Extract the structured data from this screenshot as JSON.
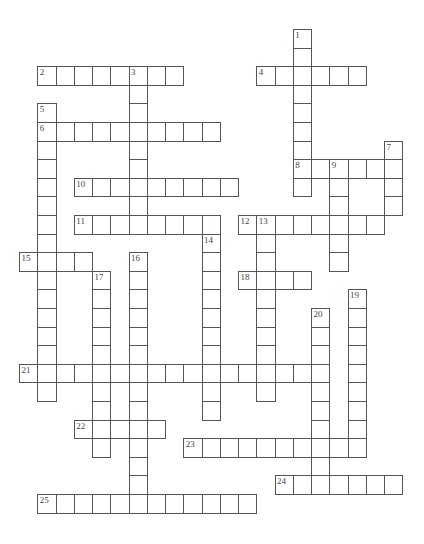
{
  "puzzle": {
    "type": "crossword",
    "grid": {
      "origin_x": 19,
      "origin_y": 29,
      "cell_w": 18.25,
      "cell_h": 18.6
    },
    "words": [
      {
        "number": 1,
        "dir": "down",
        "col": 15,
        "row": 0,
        "length": 9
      },
      {
        "number": 2,
        "dir": "across",
        "col": 1,
        "row": 2,
        "length": 8
      },
      {
        "number": 3,
        "dir": "down",
        "col": 6,
        "row": 2,
        "length": 9
      },
      {
        "number": 4,
        "dir": "across",
        "col": 13,
        "row": 2,
        "length": 6
      },
      {
        "number": 5,
        "dir": "down",
        "col": 1,
        "row": 4,
        "length": 16
      },
      {
        "number": 6,
        "dir": "across",
        "col": 1,
        "row": 5,
        "length": 10
      },
      {
        "number": 7,
        "dir": "down",
        "col": 20,
        "row": 6,
        "length": 4
      },
      {
        "number": 8,
        "dir": "across",
        "col": 15,
        "row": 7,
        "length": 6
      },
      {
        "number": 9,
        "dir": "down",
        "col": 17,
        "row": 7,
        "length": 6
      },
      {
        "number": 10,
        "dir": "across",
        "col": 3,
        "row": 8,
        "length": 9
      },
      {
        "number": 11,
        "dir": "across",
        "col": 3,
        "row": 10,
        "length": 8
      },
      {
        "number": 12,
        "dir": "across",
        "col": 12,
        "row": 10,
        "length": 8
      },
      {
        "number": 13,
        "dir": "down",
        "col": 13,
        "row": 10,
        "length": 10
      },
      {
        "number": 14,
        "dir": "down",
        "col": 10,
        "row": 11,
        "length": 10
      },
      {
        "number": 15,
        "dir": "across",
        "col": 0,
        "row": 12,
        "length": 4
      },
      {
        "number": 16,
        "dir": "down",
        "col": 6,
        "row": 12,
        "length": 14
      },
      {
        "number": 17,
        "dir": "down",
        "col": 4,
        "row": 13,
        "length": 10
      },
      {
        "number": 18,
        "dir": "across",
        "col": 12,
        "row": 13,
        "length": 4
      },
      {
        "number": 19,
        "dir": "down",
        "col": 18,
        "row": 14,
        "length": 9
      },
      {
        "number": 20,
        "dir": "down",
        "col": 16,
        "row": 15,
        "length": 10
      },
      {
        "number": 21,
        "dir": "across",
        "col": 0,
        "row": 18,
        "length": 17
      },
      {
        "number": 22,
        "dir": "across",
        "col": 3,
        "row": 21,
        "length": 5
      },
      {
        "number": 23,
        "dir": "across",
        "col": 9,
        "row": 22,
        "length": 10
      },
      {
        "number": 24,
        "dir": "across",
        "col": 14,
        "row": 24,
        "length": 7
      },
      {
        "number": 25,
        "dir": "across",
        "col": 1,
        "row": 25,
        "length": 12
      }
    ],
    "colors": {
      "border": "#555555",
      "background": "#ffffff",
      "number": "#444444"
    }
  }
}
